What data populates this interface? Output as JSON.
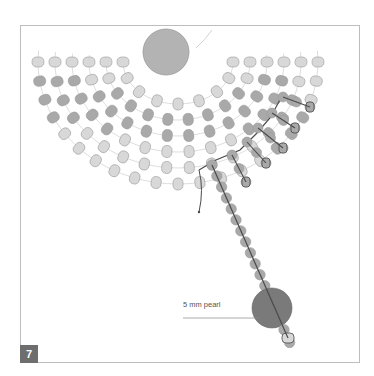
{
  "figure": {
    "step_number": "7",
    "label_pearl": "5 mm pearl"
  },
  "colors": {
    "frame": "#bdbdbd",
    "bead_light": "#d8d8d8",
    "bead_dark": "#a9a9a9",
    "bead_stroke": "#9a9a9a",
    "big_bead": "#b3b3b3",
    "pearl": "#7a7a7a",
    "thread_light": "#c8c8c8",
    "thread_dark": "#4a4a4a",
    "badge": "#6e6e6e"
  },
  "fan": {
    "center": [
      178,
      62
    ],
    "rows": [
      {
        "rx": 140,
        "ry": 122,
        "count": 21,
        "pattern": "LDDDLLLLLLLLLLLDDDLLL"
      },
      {
        "rx": 123,
        "ry": 106,
        "count": 18,
        "pattern": "LDDDLLLLLLLLLDDDLL"
      },
      {
        "rx": 106,
        "ry": 90,
        "count": 16,
        "pattern": "LDDDDLLLLLLDDDDL"
      },
      {
        "rx": 89,
        "ry": 74,
        "count": 14,
        "pattern": "LLDDDDDDDDDDDL"
      },
      {
        "rx": 72,
        "ry": 58,
        "count": 12,
        "pattern": "LLDDDDDDDDLL"
      },
      {
        "rx": 55,
        "ry": 42,
        "count": 9,
        "pattern": "LLLLLLLLL"
      }
    ]
  },
  "fringes": [
    {
      "start": [
        283,
        97
      ],
      "end": [
        310,
        107
      ],
      "beads": 3
    },
    {
      "start": [
        272,
        113
      ],
      "end": [
        295,
        128
      ],
      "beads": 3
    },
    {
      "start": [
        258,
        128
      ],
      "end": [
        283,
        148
      ],
      "beads": 3
    },
    {
      "start": [
        247,
        142
      ],
      "end": [
        266,
        163
      ],
      "beads": 3
    },
    {
      "start": [
        232,
        155
      ],
      "end": [
        246,
        182
      ],
      "beads": 3
    }
  ],
  "main_strand": {
    "start": [
      212,
      165
    ],
    "end": [
      292,
      348
    ],
    "beads": 13,
    "pearl": [
      272,
      308,
      20
    ]
  }
}
